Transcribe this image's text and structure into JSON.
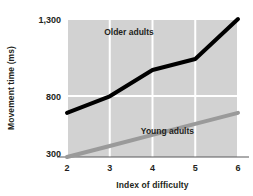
{
  "chart_data": {
    "type": "line",
    "title": "",
    "subtitle": "",
    "xlabel": "Index of difficulty",
    "ylabel": "Movement time (ms)",
    "x": [
      2,
      3,
      4,
      5,
      6
    ],
    "xlim": [
      2,
      6
    ],
    "ylim": [
      300,
      1300
    ],
    "xticks": [
      "2",
      "3",
      "4",
      "5",
      "6"
    ],
    "yticks": [
      "300",
      "800",
      "1,300"
    ],
    "ytick_values": [
      300,
      800,
      1300
    ],
    "grid": true,
    "grid_color": "#ffffff",
    "plot_background": "#d2d2d2",
    "legend_position": "inline-annotations",
    "series": [
      {
        "name": "Older adults",
        "values": [
          620,
          740,
          930,
          1010,
          1300
        ],
        "color": "#000000",
        "line_width": 4,
        "label_x": 3.45,
        "label_y": 1185
      },
      {
        "name": "Young adults",
        "values": [
          300,
          380,
          460,
          540,
          620
        ],
        "color": "#9a9a9a",
        "line_width": 4,
        "label_x": 4.35,
        "label_y": 470
      }
    ],
    "annotations": [
      {
        "text": "Older adults"
      },
      {
        "text": "Young adults"
      }
    ]
  }
}
